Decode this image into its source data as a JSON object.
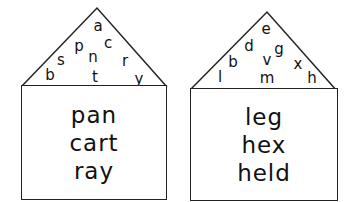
{
  "houses": [
    {
      "roof_letters": [
        {
          "char": "a",
          "x": 98,
          "y": 26
        },
        {
          "char": "p",
          "x": 79,
          "y": 46
        },
        {
          "char": "c",
          "x": 108,
          "y": 43
        },
        {
          "char": "s",
          "x": 61,
          "y": 60
        },
        {
          "char": "n",
          "x": 93,
          "y": 57
        },
        {
          "char": "r",
          "x": 125,
          "y": 61
        },
        {
          "char": "b",
          "x": 50,
          "y": 75
        },
        {
          "char": "t",
          "x": 95,
          "y": 77
        },
        {
          "char": "y",
          "x": 139,
          "y": 79
        }
      ],
      "words": [
        "pan",
        "cart",
        "ray"
      ]
    },
    {
      "roof_letters": [
        {
          "char": "e",
          "x": 266,
          "y": 29
        },
        {
          "char": "d",
          "x": 249,
          "y": 46
        },
        {
          "char": "g",
          "x": 279,
          "y": 49
        },
        {
          "char": "b",
          "x": 233,
          "y": 62
        },
        {
          "char": "v",
          "x": 267,
          "y": 60
        },
        {
          "char": "x",
          "x": 298,
          "y": 64
        },
        {
          "char": "l",
          "x": 220,
          "y": 77
        },
        {
          "char": "m",
          "x": 267,
          "y": 78
        },
        {
          "char": "h",
          "x": 312,
          "y": 78
        }
      ],
      "words": [
        "leg",
        "hex",
        "held"
      ]
    }
  ]
}
